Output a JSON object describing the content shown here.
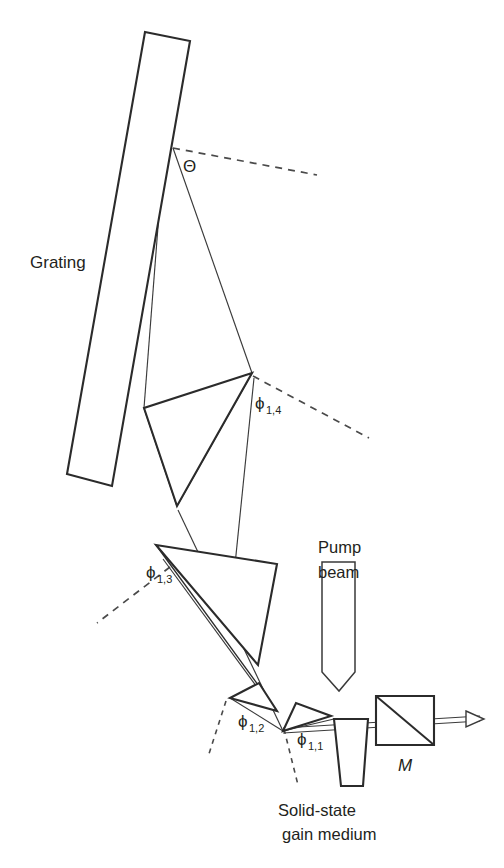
{
  "figure": {
    "background_color": "#ffffff",
    "line_color": "#2b2b2b",
    "ray_color": "#3a3a3a",
    "dash_color": "#4a4a4a"
  },
  "labels": {
    "grating": "Grating",
    "theta": "Θ",
    "phi_1_4_base": "ϕ",
    "phi_1_4_sub": "1,4",
    "phi_1_3_base": "ϕ",
    "phi_1_3_sub": "1,3",
    "phi_1_2_base": "ϕ",
    "phi_1_2_sub": "1,2",
    "phi_1_1_base": "ϕ",
    "phi_1_1_sub": "1,1",
    "mirror": "M",
    "pump_line1": "Pump",
    "pump_line2": "beam",
    "gain_line1": "Solid-state",
    "gain_line2": "gain medium"
  },
  "components": [
    {
      "name": "grating",
      "kind": "diffraction-grating",
      "shape": "rectangle-tilted",
      "points": "145,32 190,41 112,486 67,474"
    },
    {
      "name": "prism-4",
      "kind": "prism",
      "shape": "triangle",
      "points": "252,373 144,408 177,506"
    },
    {
      "name": "prism-3",
      "kind": "prism",
      "shape": "triangle",
      "points": "156,545 277,564 258,665"
    },
    {
      "name": "prism-2",
      "kind": "prism",
      "shape": "triangle",
      "points": "230,698 259,683 277,711"
    },
    {
      "name": "prism-1",
      "kind": "prism",
      "shape": "triangle",
      "points": "283,731 296,703 331,716"
    },
    {
      "name": "gain-medium",
      "kind": "solid-state-gain-medium",
      "shape": "trapezoid",
      "points": "334,719 368,719 363,786 341,786"
    },
    {
      "name": "beamsplitter-M",
      "kind": "output-coupler",
      "shape": "square-with-diagonal",
      "points": "376,696 434,696 434,745 376,745"
    },
    {
      "name": "pump-beam",
      "kind": "beam-arrow",
      "shape": "vertical-band-with-point",
      "points": "322,562 355,562 355,672 339,691 322,672"
    }
  ],
  "rays": [
    {
      "name": "grating-to-prism4-apex",
      "path": "173,148 252,373"
    },
    {
      "name": "grating-to-prism4-left",
      "path": "164,149 144,408"
    },
    {
      "name": "prism4-left-to-prism3",
      "path": "144,408 177,506"
    },
    {
      "name": "prism4-apex-to-prism3-bottom",
      "path": "252,373 177,506"
    },
    {
      "name": "prism4-apex-down-to-prism3",
      "path": "254,378 231,604"
    },
    {
      "name": "prism3-apex-to-prism2",
      "path": "156,545 277,711"
    },
    {
      "name": "prism3-to-prism2-inner",
      "path": "163,559 273,709"
    },
    {
      "name": "prism3-lower-to-prism1",
      "path": "178,510 283,731"
    },
    {
      "name": "prism2-to-prism1",
      "path": "230,698 283,731"
    },
    {
      "name": "prism1-to-gain",
      "path": "283,731 334,719"
    },
    {
      "name": "cavity-axis-lower",
      "path": "283,733 480,721"
    },
    {
      "name": "cavity-axis-upper",
      "path": "283,728 480,716"
    }
  ],
  "reference_lines": [
    {
      "name": "theta-reference",
      "path": "173,148 317,175"
    },
    {
      "name": "phi14-reference",
      "path": "253,376 369,438"
    },
    {
      "name": "phi13-reference",
      "path": "170,567 97,623"
    },
    {
      "name": "phi12-reference",
      "path": "226,701 208,757"
    },
    {
      "name": "phi11-reference",
      "path": "284,729 298,785"
    }
  ],
  "label_positions": {
    "grating": {
      "x": 30,
      "y": 268
    },
    "theta": {
      "x": 183,
      "y": 172
    },
    "phi_1_4": {
      "x": 255,
      "y": 409
    },
    "phi_1_3": {
      "x": 146,
      "y": 578
    },
    "phi_1_2": {
      "x": 238,
      "y": 727
    },
    "phi_1_1": {
      "x": 297,
      "y": 745
    },
    "mirror": {
      "x": 398,
      "y": 771
    },
    "pump": {
      "x": 318,
      "y": 553
    },
    "gain": {
      "x": 278,
      "y": 816
    }
  }
}
